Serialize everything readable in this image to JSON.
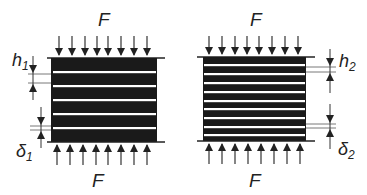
{
  "figure": {
    "left": {
      "force_top": "F",
      "force_bottom": "F",
      "layer_thickness_label": "h",
      "layer_thickness_sub": "1",
      "gap_label": "δ",
      "gap_sub": "1",
      "white_layers": 5
    },
    "right": {
      "force_top": "F",
      "force_bottom": "F",
      "layer_thickness_label": "h",
      "layer_thickness_sub": "2",
      "gap_label": "δ",
      "gap_sub": "2",
      "white_layers": 9
    },
    "colors": {
      "block": "#1a1a1a",
      "layer": "#ffffff",
      "line": "#333333"
    }
  }
}
